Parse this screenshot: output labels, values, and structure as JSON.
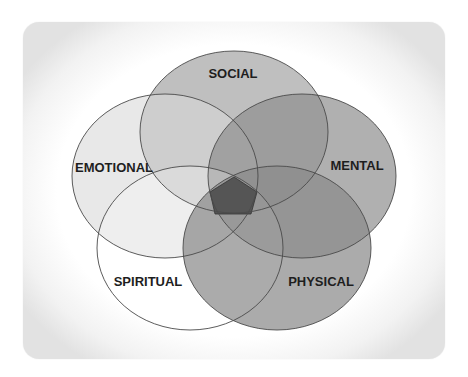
{
  "diagram": {
    "type": "venn",
    "sets": [
      {
        "id": "social",
        "label": "SOCIAL",
        "fill": "#b4b4b4",
        "opacity": 0.85,
        "cx": 234,
        "cy": 132,
        "rx": 94,
        "ry": 81,
        "label_x": 233,
        "label_y": 78
      },
      {
        "id": "emotional",
        "label": "EMOTIONAL",
        "fill": "#d9d9d9",
        "opacity": 0.6,
        "cx": 165,
        "cy": 176,
        "rx": 93,
        "ry": 82,
        "label_x": 114,
        "label_y": 172
      },
      {
        "id": "mental",
        "label": "MENTAL",
        "fill": "#8f8f8f",
        "opacity": 0.7,
        "cx": 302,
        "cy": 176,
        "rx": 94,
        "ry": 82,
        "label_x": 357,
        "label_y": 170
      },
      {
        "id": "spiritual",
        "label": "SPIRITUAL",
        "fill": "#ffffff",
        "opacity": 0.25,
        "cx": 190,
        "cy": 248,
        "rx": 93,
        "ry": 82,
        "label_x": 148,
        "label_y": 286
      },
      {
        "id": "physical",
        "label": "PHYSICAL",
        "fill": "#8a8a8a",
        "opacity": 0.72,
        "cx": 277,
        "cy": 248,
        "rx": 94,
        "ry": 82,
        "label_x": 321,
        "label_y": 286
      }
    ],
    "center": {
      "label": "",
      "fill": "#555555",
      "points": "234,177 257,192 251,214 215,214 210,192"
    },
    "stroke": "#4a4a4a"
  }
}
